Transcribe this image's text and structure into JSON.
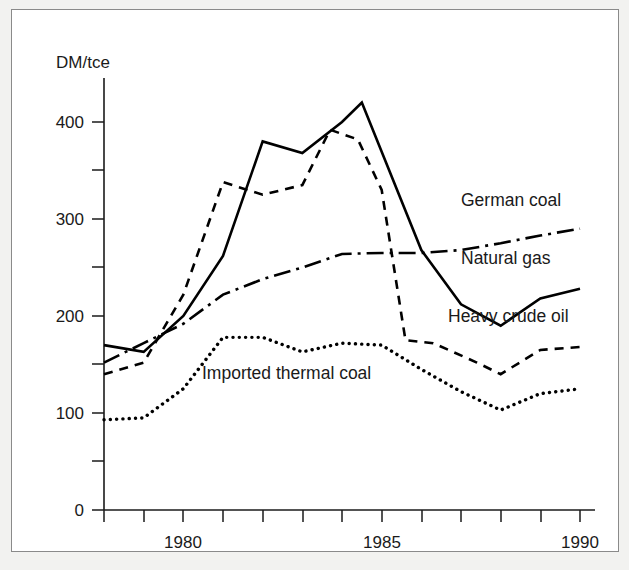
{
  "figure": {
    "background_color": "#f2f2f0",
    "panel_color": "#ffffff",
    "border_color": "#8a8a8a",
    "ink_color": "#000000"
  },
  "chart_data": {
    "type": "line",
    "title": "",
    "subtitle": "",
    "xlabel": "",
    "ylabel": "DM/tce",
    "xlim": [
      1978,
      1990
    ],
    "ylim": [
      0,
      440
    ],
    "grid": false,
    "legend_position": "inline-annotations",
    "y_ticks_major": [
      0,
      100,
      200,
      300,
      400
    ],
    "y_ticks_minor": [
      50,
      150,
      250,
      350
    ],
    "y_tick_labels": [
      "0",
      "100",
      "200",
      "300",
      "400"
    ],
    "x_ticks": [
      1978,
      1979,
      1980,
      1981,
      1982,
      1983,
      1984,
      1985,
      1986,
      1987,
      1988,
      1989,
      1990
    ],
    "x_tick_labels_shown": [
      "1980",
      "1985",
      "1990"
    ],
    "x_tick_label_values": [
      1980,
      1985,
      1990
    ],
    "series": [
      {
        "name": "German coal",
        "line_style": "solid",
        "label_anchor": {
          "x": 1987.0,
          "y": 312
        },
        "x": [
          1978.0,
          1979.0,
          1980.0,
          1981.0,
          1982.0,
          1983.0,
          1984.0,
          1984.5,
          1986.0,
          1987.0,
          1988.0,
          1989.0,
          1990.0
        ],
        "values": [
          170,
          163,
          200,
          262,
          380,
          368,
          400,
          420,
          268,
          212,
          190,
          218,
          228
        ]
      },
      {
        "name": "Natural gas",
        "line_style": "dash-dot",
        "label_anchor": {
          "x": 1987.0,
          "y": 252
        },
        "x": [
          1978.0,
          1979.0,
          1980.0,
          1981.0,
          1982.0,
          1983.0,
          1984.0,
          1985.0,
          1986.0,
          1987.0,
          1988.0,
          1989.0,
          1990.0
        ],
        "values": [
          152,
          172,
          192,
          222,
          238,
          250,
          264,
          265,
          265,
          268,
          275,
          283,
          290
        ]
      },
      {
        "name": "Heavy crude oil",
        "line_style": "dashed",
        "label_anchor": {
          "x": 1986.6,
          "y": 192
        },
        "x": [
          1978.0,
          1979.0,
          1980.0,
          1981.0,
          1982.0,
          1983.0,
          1983.7,
          1984.4,
          1985.0,
          1985.6,
          1986.3,
          1987.4,
          1988.0,
          1989.0,
          1990.0
        ],
        "values": [
          140,
          152,
          222,
          338,
          325,
          335,
          392,
          382,
          330,
          175,
          172,
          152,
          140,
          165,
          168
        ]
      },
      {
        "name": "Imported thermal coal",
        "line_style": "dotted",
        "label_anchor": {
          "x": 1980.1,
          "y": 137
        },
        "x": [
          1978.0,
          1979.0,
          1980.0,
          1981.0,
          1982.0,
          1983.0,
          1984.0,
          1985.0,
          1986.0,
          1987.0,
          1988.0,
          1989.0,
          1990.0
        ],
        "values": [
          93,
          95,
          125,
          178,
          178,
          163,
          172,
          170,
          145,
          122,
          103,
          120,
          125
        ]
      }
    ]
  },
  "labels": {
    "y_axis_title": "DM/tce",
    "series_german_coal": "German coal",
    "series_natural_gas": "Natural gas",
    "series_heavy_crude_oil": "Heavy crude oil",
    "series_imported_thermal_coal": "Imported thermal coal",
    "ytick_0": "0",
    "ytick_100": "100",
    "ytick_200": "200",
    "ytick_300": "300",
    "ytick_400": "400",
    "xtick_1980": "1980",
    "xtick_1985": "1985",
    "xtick_1990": "1990"
  }
}
